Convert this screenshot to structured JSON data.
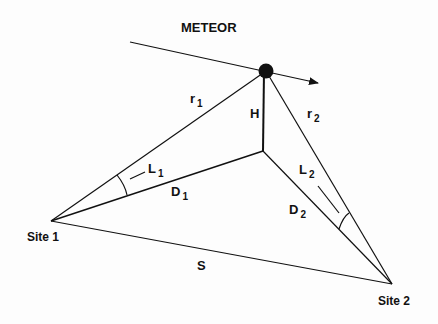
{
  "diagram": {
    "title": "METEOR",
    "labels": {
      "r1": {
        "main": "r",
        "sub": "1"
      },
      "r2": {
        "main": "r",
        "sub": "2"
      },
      "H": "H",
      "L1": {
        "main": "L",
        "sub": "1"
      },
      "L2": {
        "main": "L",
        "sub": "2"
      },
      "D1": {
        "main": "D",
        "sub": "1"
      },
      "D2": {
        "main": "D",
        "sub": "2"
      },
      "S": "S",
      "site1": "Site 1",
      "site2": "Site 2"
    },
    "points": {
      "meteor": [
        266,
        71
      ],
      "ground": [
        263,
        151
      ],
      "site1": [
        51,
        221
      ],
      "site2": [
        392,
        284
      ],
      "trajectory_start": [
        130,
        42
      ],
      "trajectory_end": [
        318,
        83
      ]
    },
    "colors": {
      "line": "#111111",
      "background": "#fdfdfd"
    }
  }
}
